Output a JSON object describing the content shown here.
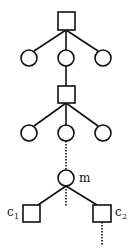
{
  "diagram": {
    "type": "tree",
    "labels": {
      "m": "m",
      "c1_base": "c",
      "c1_sub": "1",
      "c2_base": "c",
      "c2_sub": "2"
    },
    "nodes": [
      {
        "id": "sq1",
        "shape": "square"
      },
      {
        "id": "ci1a",
        "shape": "circle"
      },
      {
        "id": "ci1b",
        "shape": "circle"
      },
      {
        "id": "ci1c",
        "shape": "circle"
      },
      {
        "id": "sq2",
        "shape": "square"
      },
      {
        "id": "ci2a",
        "shape": "circle"
      },
      {
        "id": "ci2b",
        "shape": "circle"
      },
      {
        "id": "ci2c",
        "shape": "circle"
      },
      {
        "id": "m",
        "shape": "circle",
        "label": "m"
      },
      {
        "id": "c1",
        "shape": "square",
        "label": "c1"
      },
      {
        "id": "c2",
        "shape": "square",
        "label": "c2"
      }
    ],
    "edges": [
      {
        "from": "sq1",
        "to": "ci1a",
        "style": "solid"
      },
      {
        "from": "sq1",
        "to": "ci1b",
        "style": "solid"
      },
      {
        "from": "sq1",
        "to": "ci1c",
        "style": "solid"
      },
      {
        "from": "ci1b",
        "to": "sq2",
        "style": "solid"
      },
      {
        "from": "sq2",
        "to": "ci2a",
        "style": "solid"
      },
      {
        "from": "sq2",
        "to": "ci2b",
        "style": "solid"
      },
      {
        "from": "sq2",
        "to": "ci2c",
        "style": "solid"
      },
      {
        "from": "ci2b",
        "to": "m",
        "style": "dotted"
      },
      {
        "from": "m",
        "to": "c1",
        "style": "solid"
      },
      {
        "from": "m",
        "to": "c2",
        "style": "solid"
      },
      {
        "from": "m",
        "to": "(continues)",
        "style": "dotted"
      },
      {
        "from": "c2",
        "to": "(continues)",
        "style": "dotted"
      }
    ]
  }
}
